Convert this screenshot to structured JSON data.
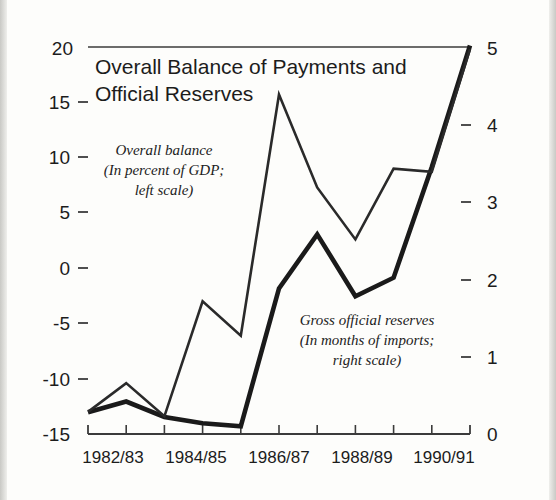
{
  "chart_data": {
    "type": "line",
    "title": "Overall Balance of Payments and Official Reserves",
    "title_line1": "Overall Balance of Payments and",
    "title_line2": "Official Reserves",
    "xlabel": "",
    "grid": false,
    "legend_position": "inline-annotations",
    "x": [
      "1982/83",
      "1983/84",
      "1984/85",
      "1985/86",
      "1986/87",
      "1987/88",
      "1988/89",
      "1989/90",
      "1990/91",
      "1991/92",
      "1992/93"
    ],
    "x_tick_labels": [
      "1982/83",
      "1984/85",
      "1986/87",
      "1988/89",
      "1990/91"
    ],
    "x_tick_label_indices": [
      0,
      2,
      4,
      6,
      8
    ],
    "left_axis": {
      "label": "",
      "ticks": [
        20,
        15,
        10,
        5,
        0,
        -5,
        -10,
        -15
      ],
      "tick_labels": [
        "20",
        "15",
        "10",
        "5",
        "0",
        "-5",
        "-10",
        "-15"
      ],
      "ylim": [
        -15,
        20
      ]
    },
    "right_axis": {
      "label": "",
      "ticks": [
        5,
        4,
        3,
        2,
        1,
        0
      ],
      "tick_labels": [
        "5",
        "4",
        "3",
        "2",
        "1",
        "0"
      ],
      "ylim": [
        0,
        5
      ]
    },
    "series": [
      {
        "name": "Overall balance",
        "axis": "left",
        "units": "In percent of GDP",
        "stroke": "#2a2a2a",
        "width": 2.6,
        "values": [
          -13.0,
          -10.4,
          -13.4,
          -3.0,
          -6.1,
          15.7,
          7.3,
          2.6,
          9.0,
          8.7,
          19.8
        ]
      },
      {
        "name": "Gross official reserves",
        "axis": "right",
        "units": "In months of imports",
        "stroke": "#1a1a1a",
        "width": 4.6,
        "values": [
          0.28,
          0.42,
          0.22,
          0.14,
          0.1,
          1.88,
          2.58,
          1.78,
          2.02,
          3.45,
          5.02
        ]
      }
    ],
    "annotations": [
      {
        "id": "overall-balance-annotation",
        "lines": [
          "Overall balance",
          "(In percent of GDP;",
          "left scale)"
        ],
        "x": 164,
        "y": 155
      },
      {
        "id": "gross-reserves-annotation",
        "lines": [
          "Gross official reserves",
          "(In months of imports;",
          "right scale)"
        ],
        "x": 367,
        "y": 325
      }
    ]
  },
  "colors": {
    "ink": "#1c1c1c",
    "axis": "#3b3b3b",
    "paper": "#fdfdfb",
    "thin_series": "#2a2a2a",
    "thick_series": "#1a1a1a"
  }
}
